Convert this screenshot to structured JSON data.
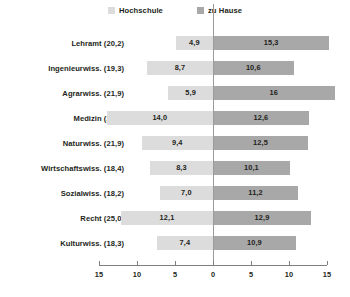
{
  "legend": {
    "position": "top-center",
    "items": [
      {
        "label": "Hochschule",
        "color": "#dcdcdc",
        "swatch_name": "legend-swatch-hochschule"
      },
      {
        "label": "zu Hause",
        "color": "#a8a8a8",
        "swatch_name": "legend-swatch-zu-hause"
      }
    ]
  },
  "axis": {
    "tick_labels": [
      "15",
      "10",
      "5",
      "0",
      "5",
      "10",
      "15"
    ],
    "tick_values": [
      -15,
      -10,
      -5,
      0,
      5,
      10,
      15
    ]
  },
  "chart_data": {
    "type": "bar",
    "title": "",
    "subtitle": "",
    "xlabel": "",
    "ylabel": "",
    "orientation": "horizontal",
    "layout": "diverging",
    "grid": false,
    "legend_position": "top-center",
    "xlim": [
      -15,
      15
    ],
    "xticks": [
      -15,
      -10,
      -5,
      0,
      5,
      10,
      15
    ],
    "xtick_labels": [
      "15",
      "10",
      "5",
      "0",
      "5",
      "10",
      "15"
    ],
    "categories": [
      "Lehramt (20,2)",
      "Ingenieurwiss. (19,3)",
      "Agrarwiss. (21,9)",
      "Medizin (26,6)",
      "Naturwiss. (21,9)",
      "Wirtschaftswiss. (18,4)",
      "Sozialwiss. (18,2)",
      "Recht (25,0)",
      "Kulturwiss. (18,3)"
    ],
    "series": [
      {
        "name": "Hochschule",
        "color": "#dcdcdc",
        "side": "left",
        "values": [
          4.9,
          8.7,
          5.9,
          14.0,
          9.4,
          8.3,
          7.0,
          12.1,
          7.4
        ],
        "labels": [
          "4,9",
          "8,7",
          "5,9",
          "14,0",
          "9,4",
          "8,3",
          "7,0",
          "12,1",
          "7,4"
        ]
      },
      {
        "name": "zu Hause",
        "color": "#a8a8a8",
        "side": "right",
        "values": [
          15.3,
          10.6,
          16.0,
          12.6,
          12.5,
          10.1,
          11.2,
          12.9,
          10.9
        ],
        "labels": [
          "15,3",
          "10,6",
          "16",
          "12,6",
          "12,5",
          "10,1",
          "11,2",
          "12,9",
          "10,9"
        ]
      }
    ]
  }
}
